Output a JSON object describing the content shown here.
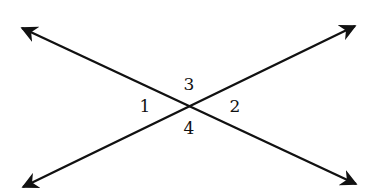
{
  "diagram": {
    "type": "intersecting-lines",
    "intersection": {
      "x": 190,
      "y": 106
    },
    "lines": [
      {
        "name": "line-a",
        "from": {
          "x": 22,
          "y": 28
        },
        "to": {
          "x": 356,
          "y": 184
        },
        "arrows": "both"
      },
      {
        "name": "line-b",
        "from": {
          "x": 23,
          "y": 187
        },
        "to": {
          "x": 355,
          "y": 26
        },
        "arrows": "both"
      }
    ],
    "angle_labels": [
      {
        "id": "angle-1",
        "text": "1",
        "x": 145,
        "y": 112
      },
      {
        "id": "angle-2",
        "text": "2",
        "x": 235,
        "y": 112
      },
      {
        "id": "angle-3",
        "text": "3",
        "x": 189,
        "y": 90
      },
      {
        "id": "angle-4",
        "text": "4",
        "x": 189,
        "y": 134
      }
    ],
    "stroke_color": "#111111"
  }
}
